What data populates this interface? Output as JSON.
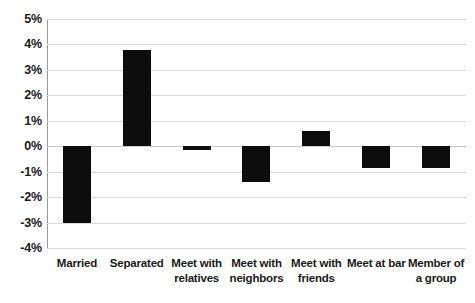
{
  "chart_data": {
    "type": "bar",
    "title": "",
    "xlabel": "",
    "ylabel": "",
    "categories": [
      "Married",
      "Separated",
      "Meet with relatives",
      "Meet with neighbors",
      "Meet with friends",
      "Meet at bar",
      "Member of a group"
    ],
    "values": [
      -3.0,
      3.8,
      -0.15,
      -1.4,
      0.6,
      -0.85,
      -0.85
    ],
    "value_labels": [
      "-3.0%",
      "3.8%",
      "-0.15%",
      "-1.4%",
      "0.6%",
      "-0.85%",
      "-0.85%"
    ],
    "ylim": [
      -4,
      5
    ],
    "ytick_labels": [
      "5%",
      "4%",
      "3%",
      "2%",
      "1%",
      "0%",
      "-1%",
      "-2%",
      "-3%",
      "-4%"
    ],
    "ytick_values": [
      5,
      4,
      3,
      2,
      1,
      0,
      -1,
      -2,
      -3,
      -4
    ],
    "grid": true,
    "legend": false,
    "bar_color": "#0d0d0d",
    "grid_color": "#d9d9d9",
    "axis_color": "#9a9a9a",
    "background": "#ffffff"
  }
}
